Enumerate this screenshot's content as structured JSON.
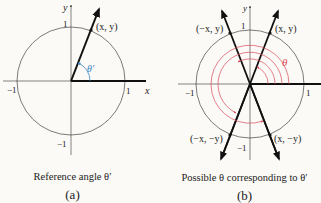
{
  "panel_a": {
    "axis_x": "x",
    "axis_y": "y",
    "tick_pos_x": "1",
    "tick_neg_x": "−1",
    "tick_pos_y": "1",
    "tick_neg_y": "−1",
    "point_label": "(x, y)",
    "angle_label": "θ′",
    "caption": "Reference angle θ′",
    "sublabel": "(a)"
  },
  "panel_b": {
    "axis_y": "y",
    "tick_pos_x": "1",
    "tick_neg_x": "−1",
    "tick_pos_y": "1",
    "tick_neg_y": "−1",
    "point_q1": "(x, y)",
    "point_q2": "(−x, y)",
    "point_q3": "(−x, −y)",
    "point_q4": "(x, −y)",
    "angle_label": "θ",
    "caption": "Possible θ corresponding to θ′",
    "sublabel": "(b)"
  },
  "colors": {
    "circle": "#7a7a7a",
    "ray": "#111111",
    "axis": "#333333",
    "ref_angle": "#3a86c4",
    "theta_arcs": "#d94a5a"
  }
}
